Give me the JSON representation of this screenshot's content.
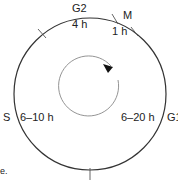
{
  "diagram": {
    "type": "cell-cycle",
    "phases": [
      {
        "name": "G2",
        "duration": "4 h"
      },
      {
        "name": "M",
        "duration": "1 h"
      },
      {
        "name": "G1",
        "duration": "6–20 h"
      },
      {
        "name": "S",
        "duration": "6–10 h"
      }
    ],
    "direction": "clockwise",
    "colors": {
      "line": "#333333",
      "inner_line": "#888888",
      "text": "#222222"
    },
    "caption_fragment": "e."
  }
}
